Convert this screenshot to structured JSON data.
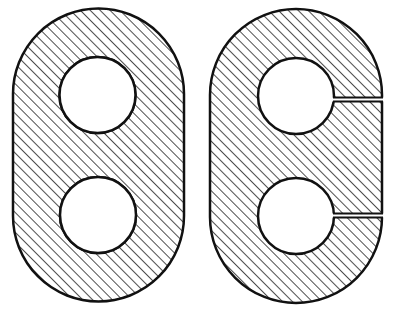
{
  "diagram": {
    "colors": {
      "background": "#ffffff",
      "stroke": "#111111",
      "hatch": "#222222",
      "hole_fill": "#ffffff"
    },
    "hatch": {
      "pattern": "diagonal-45deg"
    },
    "figures": [
      {
        "id": "left-part",
        "name": "solid-link-section",
        "holes": 2,
        "slits": 0
      },
      {
        "id": "right-part",
        "name": "split-link-section",
        "holes": 2,
        "slits": 2
      }
    ]
  }
}
